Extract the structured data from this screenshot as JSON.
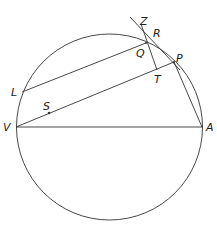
{
  "diagram": {
    "type": "geometry-circle-orbit",
    "stroke_color": "#333333",
    "circle": {
      "cx": 109.5,
      "cy": 127,
      "r": 93
    },
    "points": {
      "V": {
        "label": "V",
        "x": 16,
        "y": 127
      },
      "A": {
        "label": "A",
        "x": 203,
        "y": 127
      },
      "L": {
        "label": "L",
        "x": 22,
        "y": 92
      },
      "S": {
        "label": "S",
        "x": 49,
        "y": 114
      },
      "Q": {
        "label": "Q",
        "x": 146,
        "y": 43
      },
      "P": {
        "label": "P",
        "x": 174,
        "y": 62
      },
      "T": {
        "label": "T",
        "x": 157,
        "y": 70
      },
      "R": {
        "label": "R",
        "x": 152,
        "y": 40
      },
      "Z": {
        "label": "Z",
        "x": 141,
        "y": 24
      }
    },
    "segments": [
      {
        "from": "V",
        "to": "A"
      },
      {
        "from": "V",
        "to": "P"
      },
      {
        "from": "L",
        "to": "Q"
      },
      {
        "from": "P",
        "to": "A"
      },
      {
        "from": "Z",
        "to": "T",
        "note": "line through Q"
      },
      {
        "from": "tangent-start",
        "to": "P",
        "note": "tangent through R"
      }
    ]
  }
}
